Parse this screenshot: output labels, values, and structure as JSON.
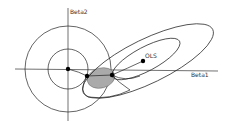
{
  "diagram": {
    "labels": {
      "y_axis": "Beta2",
      "x_axis": "Beta1",
      "ols": "OLS"
    },
    "colors": {
      "stroke": "#222222",
      "shaded_region": "#aaaaaa",
      "background": "#ffffff"
    },
    "points": [
      {
        "name": "origin",
        "x": 68,
        "y": 69
      },
      {
        "name": "ols",
        "x": 143,
        "y": 61
      },
      {
        "name": "intersection-left",
        "x": 87,
        "y": 76
      },
      {
        "name": "intersection-right",
        "x": 112,
        "y": 75
      }
    ]
  }
}
